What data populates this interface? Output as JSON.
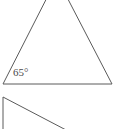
{
  "figure": {
    "background_color": "#ffffff",
    "stroke_color": "#5a5a5a",
    "text_color": "#4a4a4a",
    "stroke_width": 1,
    "canvas": {
      "width": 127,
      "height": 129
    },
    "labels": {
      "base_angle": "65°"
    },
    "label_positions": {
      "base_angle": {
        "x": 13,
        "y": 67
      }
    },
    "shapes": [
      {
        "name": "large-triangle",
        "type": "triangle",
        "cropped": "apex-above-top-edge",
        "vertices": [
          {
            "name": "apex",
            "x": 57,
            "y": -22
          },
          {
            "name": "bottom-left",
            "x": 3,
            "y": 84
          },
          {
            "name": "bottom-right",
            "x": 112,
            "y": 84
          }
        ],
        "edges": [
          {
            "name": "left-side",
            "from": "apex",
            "to": "bottom-left"
          },
          {
            "name": "right-side",
            "from": "apex",
            "to": "bottom-right"
          },
          {
            "name": "base",
            "from": "bottom-left",
            "to": "bottom-right"
          }
        ]
      },
      {
        "name": "partial-shape",
        "type": "partial-polygon",
        "cropped": "bottom-edge",
        "vertices": [
          {
            "name": "top-corner",
            "x": 3,
            "y": 97
          },
          {
            "name": "diagonal-end",
            "x": 66,
            "y": 129
          },
          {
            "name": "vertical-end",
            "x": 3,
            "y": 129
          }
        ],
        "edges": [
          {
            "name": "vertical-side",
            "from": "top-corner",
            "to": "vertical-end"
          },
          {
            "name": "diagonal-side",
            "from": "top-corner",
            "to": "diagonal-end"
          }
        ]
      }
    ]
  }
}
